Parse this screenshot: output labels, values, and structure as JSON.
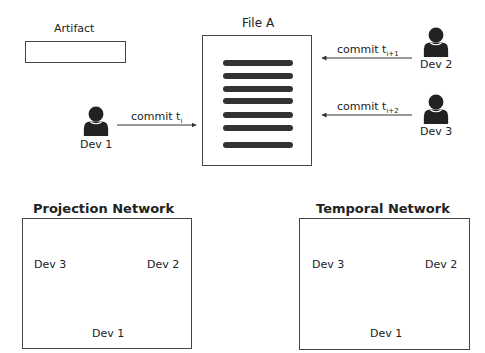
{
  "top": {
    "artifact_label": "Artifact",
    "file_label": "File A",
    "developers": [
      {
        "name": "Dev 1",
        "commit_label": "commit t",
        "commit_sub": "i"
      },
      {
        "name": "Dev 2",
        "commit_label": "commit t",
        "commit_sub": "i+1"
      },
      {
        "name": "Dev 3",
        "commit_label": "commit t",
        "commit_sub": "i+2"
      }
    ],
    "file_line_count": 7
  },
  "projection": {
    "title": "Projection Network",
    "nodes": [
      "Dev 3",
      "Dev 2",
      "Dev 1"
    ],
    "edges": [
      {
        "from": "Dev 3",
        "to": "Dev 2",
        "directed": false
      },
      {
        "from": "Dev 3",
        "to": "Dev 1",
        "directed": false
      },
      {
        "from": "Dev 2",
        "to": "Dev 1",
        "directed": false
      }
    ]
  },
  "temporal": {
    "title": "Temporal Network",
    "nodes": [
      "Dev 3",
      "Dev 2",
      "Dev 1"
    ],
    "edges": [
      {
        "from": "Dev 1",
        "to": "Dev 2",
        "directed": true
      },
      {
        "from": "Dev 2",
        "to": "Dev 3",
        "directed": true
      }
    ]
  },
  "icons": {
    "person": "person-icon",
    "document": "document-icon"
  },
  "colors": {
    "icon": "#222222",
    "line": "#333333",
    "border": "#444444"
  }
}
